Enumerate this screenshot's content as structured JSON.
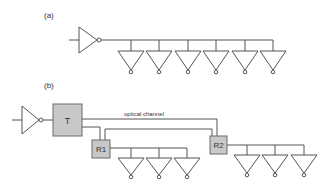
{
  "labels": {
    "part_a": "(a)",
    "part_b": "(b)",
    "transmitter": "T",
    "receiver1": "R1",
    "receiver2": "R2",
    "channel": "optical channel"
  },
  "colors": {
    "line": "#555555",
    "box_fill": "#c8c8c8",
    "background": "#ffffff"
  },
  "diagram_a": {
    "loads": 6,
    "load_x": [
      131,
      159,
      188,
      216,
      245,
      273
    ]
  },
  "diagram_b": {
    "r1_load_x": [
      131,
      159,
      187
    ],
    "r2_load_x": [
      247,
      275,
      304
    ]
  }
}
